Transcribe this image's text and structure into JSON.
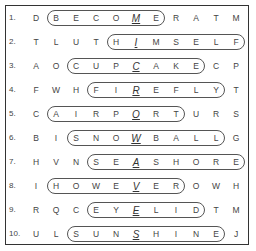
{
  "puzzle": {
    "rows": [
      {
        "num": "1.",
        "letters": [
          "D",
          "B",
          "E",
          "C",
          "O",
          "M",
          "E",
          "R",
          "A",
          "T",
          "M"
        ],
        "word_start": 1,
        "word_end": 6,
        "underline": 5
      },
      {
        "num": "2.",
        "letters": [
          "T",
          "L",
          "U",
          "T",
          "H",
          "I",
          "M",
          "S",
          "E",
          "L",
          "F"
        ],
        "word_start": 4,
        "word_end": 10,
        "underline": 5
      },
      {
        "num": "3.",
        "letters": [
          "A",
          "O",
          "C",
          "U",
          "P",
          "C",
          "A",
          "K",
          "E",
          "C",
          "P"
        ],
        "word_start": 2,
        "word_end": 8,
        "underline": 5
      },
      {
        "num": "4.",
        "letters": [
          "F",
          "W",
          "H",
          "F",
          "I",
          "R",
          "E",
          "F",
          "L",
          "Y",
          "T"
        ],
        "word_start": 3,
        "word_end": 9,
        "underline": 5
      },
      {
        "num": "5.",
        "letters": [
          "C",
          "A",
          "I",
          "R",
          "P",
          "O",
          "R",
          "T",
          "U",
          "R",
          "S"
        ],
        "word_start": 1,
        "word_end": 7,
        "underline": 5
      },
      {
        "num": "6.",
        "letters": [
          "B",
          "I",
          "S",
          "N",
          "O",
          "W",
          "B",
          "A",
          "L",
          "L",
          "G"
        ],
        "word_start": 2,
        "word_end": 9,
        "underline": 5
      },
      {
        "num": "7.",
        "letters": [
          "H",
          "V",
          "N",
          "S",
          "E",
          "A",
          "S",
          "H",
          "O",
          "R",
          "E"
        ],
        "word_start": 3,
        "word_end": 10,
        "underline": 5
      },
      {
        "num": "8.",
        "letters": [
          "I",
          "H",
          "O",
          "W",
          "E",
          "V",
          "E",
          "R",
          "O",
          "W",
          "H"
        ],
        "word_start": 1,
        "word_end": 7,
        "underline": 5
      },
      {
        "num": "9.",
        "letters": [
          "R",
          "Q",
          "C",
          "E",
          "Y",
          "E",
          "L",
          "I",
          "D",
          "T",
          "M"
        ],
        "word_start": 3,
        "word_end": 8,
        "underline": 5
      },
      {
        "num": "10.",
        "letters": [
          "U",
          "L",
          "S",
          "U",
          "N",
          "S",
          "H",
          "I",
          "N",
          "E",
          "J"
        ],
        "word_start": 2,
        "word_end": 9,
        "underline": 5
      }
    ]
  }
}
